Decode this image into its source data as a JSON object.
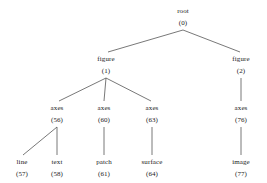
{
  "diagram": {
    "type": "tree",
    "title": "",
    "orientation": "top-down",
    "edge_color": "#555555",
    "text_color": "#1a1a1a",
    "background": "#ffffff",
    "nodes": [
      {
        "key": "root",
        "label": "root",
        "id": "(0)",
        "x": 183,
        "y": 8,
        "level": 0
      },
      {
        "key": "figure1",
        "label": "figure",
        "id": "(1)",
        "x": 106,
        "y": 56,
        "level": 1
      },
      {
        "key": "figure2",
        "label": "figure",
        "id": "(2)",
        "x": 241,
        "y": 56,
        "level": 1
      },
      {
        "key": "axes56",
        "label": "axes",
        "id": "(56)",
        "x": 57,
        "y": 105,
        "level": 2
      },
      {
        "key": "axes60",
        "label": "axes",
        "id": "(60)",
        "x": 104,
        "y": 105,
        "level": 2
      },
      {
        "key": "axes63",
        "label": "axes",
        "id": "(63)",
        "x": 152,
        "y": 105,
        "level": 2
      },
      {
        "key": "axes76",
        "label": "axes",
        "id": "(76)",
        "x": 241,
        "y": 105,
        "level": 2
      },
      {
        "key": "line57",
        "label": "line",
        "id": "(57)",
        "x": 22,
        "y": 159,
        "level": 3
      },
      {
        "key": "text58",
        "label": "text",
        "id": "(58)",
        "x": 57,
        "y": 159,
        "level": 3
      },
      {
        "key": "patch61",
        "label": "patch",
        "id": "(61)",
        "x": 104,
        "y": 159,
        "level": 3
      },
      {
        "key": "surface64",
        "label": "surface",
        "id": "(64)",
        "x": 152,
        "y": 159,
        "level": 3
      },
      {
        "key": "image77",
        "label": "image",
        "id": "(77)",
        "x": 241,
        "y": 159,
        "level": 3
      }
    ],
    "edges": [
      {
        "from": "root",
        "to": "figure1",
        "x1": 183,
        "y1": 30,
        "x2": 108,
        "y2": 52
      },
      {
        "from": "root",
        "to": "figure2",
        "x1": 183,
        "y1": 30,
        "x2": 240,
        "y2": 52
      },
      {
        "from": "figure1",
        "to": "axes56",
        "x1": 106,
        "y1": 78,
        "x2": 59,
        "y2": 101
      },
      {
        "from": "figure1",
        "to": "axes60",
        "x1": 106,
        "y1": 78,
        "x2": 104,
        "y2": 101
      },
      {
        "from": "figure1",
        "to": "axes63",
        "x1": 106,
        "y1": 78,
        "x2": 151,
        "y2": 101
      },
      {
        "from": "figure2",
        "to": "axes76",
        "x1": 241,
        "y1": 78,
        "x2": 241,
        "y2": 101
      },
      {
        "from": "axes56",
        "to": "line57",
        "x1": 57,
        "y1": 127,
        "x2": 23,
        "y2": 155
      },
      {
        "from": "axes56",
        "to": "text58",
        "x1": 57,
        "y1": 127,
        "x2": 57,
        "y2": 155
      },
      {
        "from": "axes60",
        "to": "patch61",
        "x1": 104,
        "y1": 127,
        "x2": 104,
        "y2": 155
      },
      {
        "from": "axes63",
        "to": "surface64",
        "x1": 152,
        "y1": 127,
        "x2": 152,
        "y2": 155
      },
      {
        "from": "axes76",
        "to": "image77",
        "x1": 241,
        "y1": 127,
        "x2": 241,
        "y2": 155
      }
    ]
  }
}
